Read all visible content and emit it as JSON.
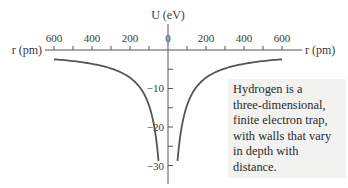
{
  "chart_data": {
    "type": "line",
    "title": "",
    "xlabel": "r (pm)",
    "ylabel": "U (eV)",
    "x_ticks": [
      600,
      400,
      200,
      0,
      200,
      400,
      600
    ],
    "x_minor_tick_step": 100,
    "y_ticks": [
      0,
      -10,
      -20,
      -30
    ],
    "y_tick_labels": [
      "0",
      "−10",
      "−20",
      "−30"
    ],
    "y_minor_tick_step": 5,
    "xlim": [
      -640,
      640
    ],
    "ylim": [
      -34,
      0
    ],
    "grid": false,
    "legend": null,
    "series": [
      {
        "name": "U(r) = −1440 eV·pm / |r|",
        "x": [
          50,
          60,
          75,
          100,
          150,
          200,
          300,
          400,
          500,
          600
        ],
        "y": [
          -28.8,
          -24.0,
          -19.2,
          -14.4,
          -9.6,
          -7.2,
          -4.8,
          -3.6,
          -2.9,
          -2.4
        ]
      }
    ],
    "symmetry": "mirrored about r = 0 (curve drawn for both negative and positive r)",
    "annotation": "Hydrogen is a three-dimensional, finite electron trap, with walls that vary in depth with distance."
  },
  "labels": {
    "x_axis_left": "r (pm)",
    "x_axis_right": "r (pm)",
    "y_axis": "U (eV)",
    "x_tick_labels": [
      "600",
      "400",
      "200",
      "0",
      "200",
      "400",
      "600"
    ],
    "y_tick_labels": [
      "−10",
      "−20",
      "−30"
    ]
  },
  "note": {
    "text": "Hydrogen is a three-dimensional, finite electron trap, with walls that vary in depth with distance.",
    "lines": [
      "Hydrogen is a",
      "three-dimensional,",
      "finite electron trap,",
      "with walls that vary",
      "in depth with",
      "distance."
    ]
  },
  "colors": {
    "curve": "#555555",
    "axis": "#555555",
    "text": "#333333",
    "note_background": "#f2f2f0"
  }
}
